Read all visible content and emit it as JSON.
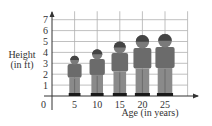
{
  "chart_data": {
    "type": "bar",
    "title": "",
    "xlabel": "Age (in years)",
    "ylabel_line1": "Height",
    "ylabel_line2": "(in ft)",
    "categories": [
      "5",
      "10",
      "15",
      "20",
      "25"
    ],
    "values": [
      3.7,
      4.3,
      5.0,
      5.6,
      5.7
    ],
    "marker": "person-figure",
    "yticks": [
      "1",
      "2",
      "3",
      "4",
      "5",
      "6",
      "7"
    ],
    "origin_label": "0",
    "ylim": [
      0,
      7.5
    ],
    "xlim": [
      0,
      30
    ],
    "grid": true,
    "legend": null
  },
  "colors": {
    "grid": "#b0b0b0",
    "axis": "#333333",
    "figure_body": "#6b6b6b",
    "figure_legs": "#8a8a8a",
    "figure_head": "#7a7a7a",
    "shoes": "#1a1a1a"
  }
}
